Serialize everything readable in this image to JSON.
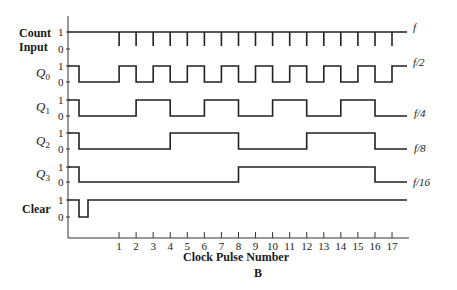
{
  "diagram": {
    "caption": "B",
    "x_axis_label": "Clock Pulse Number",
    "ticks": [
      "1",
      "2",
      "3",
      "4",
      "5",
      "6",
      "7",
      "8",
      "9",
      "10",
      "11",
      "12",
      "13",
      "14",
      "15",
      "16",
      "17"
    ],
    "level_high": "1",
    "level_low": "0",
    "signals": [
      {
        "id": "count",
        "label_line1": "Count",
        "label_line2": "Input",
        "style": "bold",
        "freq_label": "f",
        "kind": "pulses",
        "pulse_at": [
          1,
          2,
          3,
          4,
          5,
          6,
          7,
          8,
          9,
          10,
          11,
          12,
          13,
          14,
          15,
          16,
          17
        ]
      },
      {
        "id": "q0",
        "label": "Q",
        "sub": "0",
        "style": "italic",
        "freq_label": "f/2",
        "kind": "square",
        "initial_high_until_clear": true,
        "transitions": [
          1,
          2,
          3,
          4,
          5,
          6,
          7,
          8,
          9,
          10,
          11,
          12,
          13,
          14,
          15,
          16,
          17
        ]
      },
      {
        "id": "q1",
        "label": "Q",
        "sub": "1",
        "style": "italic",
        "freq_label": "f/4",
        "kind": "square",
        "initial_high_until_clear": true,
        "transitions": [
          2,
          4,
          6,
          8,
          10,
          12,
          14,
          16
        ]
      },
      {
        "id": "q2",
        "label": "Q",
        "sub": "2",
        "style": "italic",
        "freq_label": "f/8",
        "kind": "square",
        "initial_high_until_clear": true,
        "transitions": [
          4,
          8,
          12,
          16
        ]
      },
      {
        "id": "q3",
        "label": "Q",
        "sub": "3",
        "style": "italic",
        "freq_label": "f/16",
        "kind": "square",
        "initial_high_until_clear": true,
        "transitions": [
          8,
          16
        ]
      },
      {
        "id": "clear",
        "label": "Clear",
        "style": "bold",
        "freq_label": "",
        "kind": "clear_pulse"
      }
    ]
  }
}
